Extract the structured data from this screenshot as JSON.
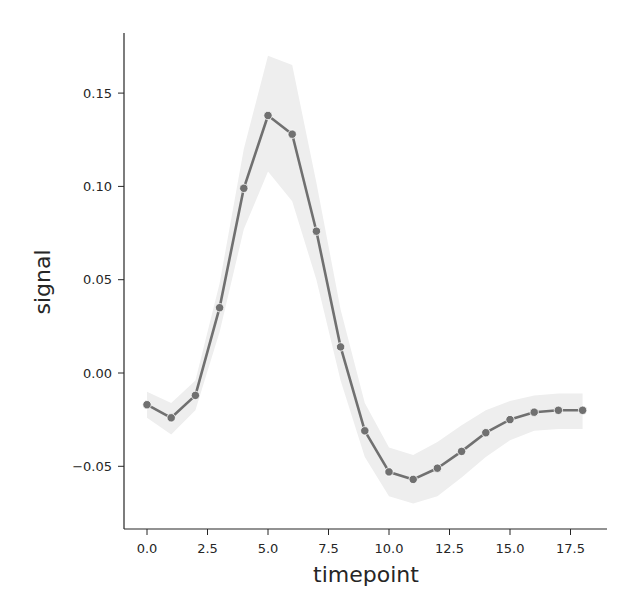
{
  "chart_data": {
    "type": "line",
    "title": "",
    "xlabel": "timepoint",
    "ylabel": "signal",
    "xlim": [
      -0.9,
      18.9
    ],
    "ylim": [
      -0.085,
      0.18
    ],
    "xticks": [
      0.0,
      2.5,
      5.0,
      7.5,
      10.0,
      12.5,
      15.0,
      17.5
    ],
    "xtick_labels": [
      "0.0",
      "2.5",
      "5.0",
      "7.5",
      "10.0",
      "12.5",
      "15.0",
      "17.5"
    ],
    "yticks": [
      -0.05,
      0.0,
      0.05,
      0.1,
      0.15
    ],
    "ytick_labels": [
      "−0.05",
      "0.00",
      "0.05",
      "0.10",
      "0.15"
    ],
    "grid": false,
    "legend": null,
    "x": [
      0,
      1,
      2,
      3,
      4,
      5,
      6,
      7,
      8,
      9,
      10,
      11,
      12,
      13,
      14,
      15,
      16,
      17,
      18
    ],
    "series": [
      {
        "name": "signal",
        "color": "#707070",
        "marker": "o",
        "values": [
          -0.017,
          -0.024,
          -0.012,
          0.035,
          0.099,
          0.138,
          0.128,
          0.076,
          0.014,
          -0.031,
          -0.053,
          -0.057,
          -0.051,
          -0.042,
          -0.032,
          -0.025,
          -0.021,
          -0.02,
          -0.02
        ],
        "ci_lower": [
          -0.024,
          -0.033,
          -0.02,
          0.022,
          0.077,
          0.108,
          0.092,
          0.05,
          -0.004,
          -0.045,
          -0.066,
          -0.07,
          -0.066,
          -0.056,
          -0.045,
          -0.036,
          -0.031,
          -0.03,
          -0.03
        ],
        "ci_upper": [
          -0.01,
          -0.016,
          -0.004,
          0.048,
          0.12,
          0.17,
          0.165,
          0.102,
          0.034,
          -0.016,
          -0.04,
          -0.044,
          -0.037,
          -0.028,
          -0.02,
          -0.015,
          -0.012,
          -0.011,
          -0.011
        ],
        "ci_color": "#eeeeee"
      }
    ]
  }
}
